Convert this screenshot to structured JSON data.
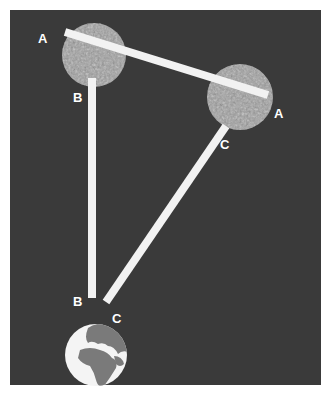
{
  "diagram": {
    "type": "three-body geometry illustration",
    "background_color": "#3a3a3a",
    "page_color": "#ffffff",
    "beam_color": "#f2f2f2",
    "bodies": [
      {
        "id": "moon-upper-left",
        "kind": "moon",
        "cx": 94,
        "cy": 55,
        "r": 32,
        "color": "#9a9a9a"
      },
      {
        "id": "moon-right",
        "kind": "moon",
        "cx": 240,
        "cy": 97,
        "r": 33,
        "color": "#9a9a9a"
      },
      {
        "id": "earth",
        "kind": "earth",
        "cx": 96,
        "cy": 355,
        "r": 31,
        "ocean_color": "#f4f4f4",
        "land_color": "#7a7a7a"
      }
    ],
    "beams": [
      {
        "id": "beam-a",
        "x1": 65,
        "y1": 32,
        "x2": 268,
        "y2": 95,
        "width": 8
      },
      {
        "id": "beam-b",
        "x1": 92,
        "y1": 78,
        "x2": 92,
        "y2": 298,
        "width": 8
      },
      {
        "id": "beam-c",
        "x1": 226,
        "y1": 126,
        "x2": 106,
        "y2": 302,
        "width": 8
      }
    ],
    "labels": [
      {
        "id": "label-a-left",
        "text": "A",
        "x": 38,
        "y": 43
      },
      {
        "id": "label-b-top",
        "text": "B",
        "x": 73,
        "y": 102
      },
      {
        "id": "label-a-right",
        "text": "A",
        "x": 274,
        "y": 118
      },
      {
        "id": "label-c-right",
        "text": "C",
        "x": 220,
        "y": 149
      },
      {
        "id": "label-b-bottom",
        "text": "B",
        "x": 73,
        "y": 306
      },
      {
        "id": "label-c-bottom",
        "text": "C",
        "x": 112,
        "y": 323
      }
    ]
  }
}
